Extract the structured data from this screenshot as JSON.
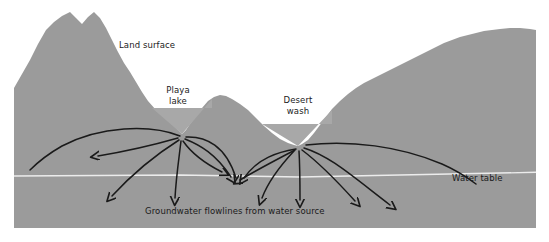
{
  "figure": {
    "type": "cross-section-diagram",
    "canvas": {
      "width": 549,
      "height": 242
    },
    "colors": {
      "background": "#ffffff",
      "ground_fill": "#9b9b9b",
      "ground_fill_light": "#a5a5a5",
      "water_table_line": "#ebebeb",
      "flowline": "#1a1a1a",
      "label_text": "#1a1a1a"
    }
  },
  "labels": {
    "land_surface": "Land surface",
    "playa_lake_line1": "Playa",
    "playa_lake_line2": "lake",
    "desert_wash_line1": "Desert",
    "desert_wash_line2": "wash",
    "water_table": "Water table",
    "caption": "Groundwater flowlines from water source"
  },
  "features": [
    {
      "name": "mountain-range",
      "description": "Twin-peaked mountain at left of section"
    },
    {
      "name": "playa-lake",
      "description": "V-shaped closed-basin depression, water source"
    },
    {
      "name": "desert-wash",
      "description": "V-shaped ephemeral channel, water source"
    },
    {
      "name": "water-table",
      "description": "Near-horizontal light line across subsurface"
    },
    {
      "name": "flowlines",
      "description": "Curved arrows radiating from playa lake and desert wash"
    }
  ],
  "flowline_count": 14
}
